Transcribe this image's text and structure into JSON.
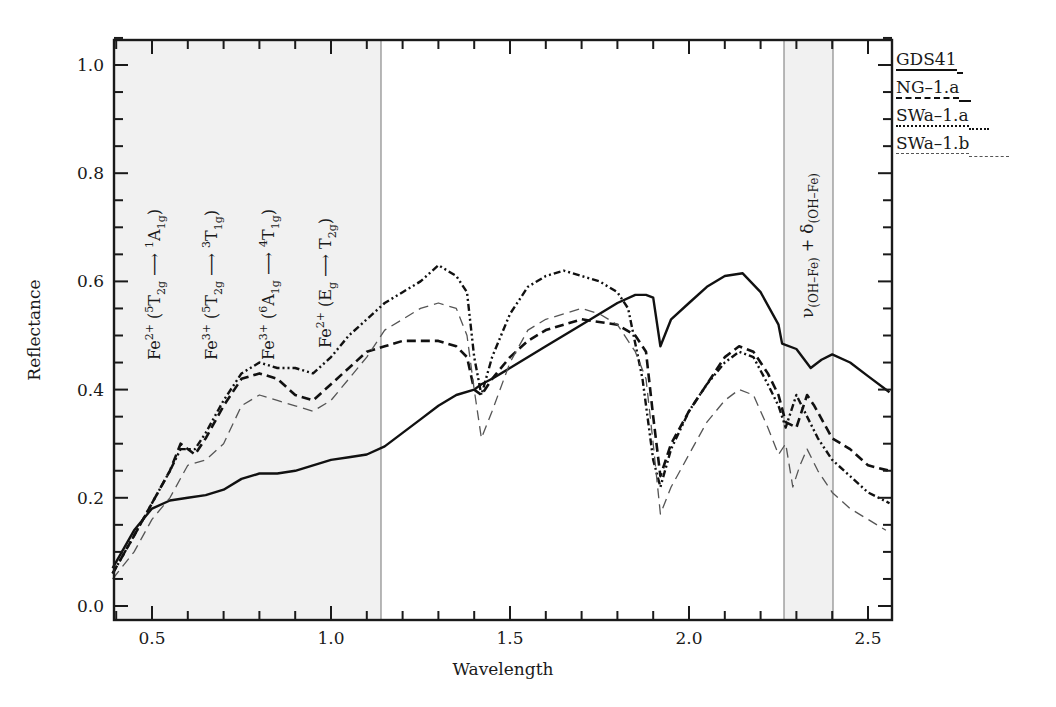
{
  "chart_data": {
    "type": "line",
    "title": "",
    "xlabel": "Wavelength",
    "ylabel": "Reflectance",
    "xlim": [
      0.39,
      2.56
    ],
    "ylim": [
      -0.02,
      1.05
    ],
    "x_ticks": [
      "0.5",
      "1.0",
      "1.5",
      "2.0",
      "2.5"
    ],
    "y_ticks": [
      "0.0",
      "0.2",
      "0.4",
      "0.6",
      "0.8",
      "1.0"
    ],
    "grid": false,
    "legend_position": "right-top",
    "legend": [
      "GDS41",
      "NG–1.a",
      "SWa–1.a",
      "SWa–1.b"
    ],
    "shaded_regions": [
      {
        "from": 0.39,
        "to": 1.14,
        "label": "Fe crystal-field transitions"
      },
      {
        "from": 2.26,
        "to": 2.4,
        "label": "ν(OH–Fe) + δ(OH–Fe)"
      }
    ],
    "annotations": [
      {
        "text": "Fe2+ (5T2g → 1A1g)",
        "x": 0.52
      },
      {
        "text": "Fe3+ (5T2g → 3T1g)",
        "x": 0.67
      },
      {
        "text": "Fe3+ (6A1g → 4T1g)",
        "x": 0.83
      },
      {
        "text": "Fe2+ (Eg → T2g)",
        "x": 0.99
      },
      {
        "text": "ν(OH–Fe) + δ(OH–Fe)",
        "x": 2.32
      }
    ],
    "series": [
      {
        "name": "GDS41",
        "style": "solid",
        "x": [
          0.39,
          0.45,
          0.5,
          0.55,
          0.6,
          0.65,
          0.7,
          0.75,
          0.8,
          0.85,
          0.9,
          0.95,
          1.0,
          1.05,
          1.1,
          1.15,
          1.2,
          1.25,
          1.3,
          1.35,
          1.4,
          1.42,
          1.45,
          1.5,
          1.6,
          1.7,
          1.8,
          1.85,
          1.88,
          1.9,
          1.92,
          1.95,
          2.0,
          2.05,
          2.1,
          2.15,
          2.2,
          2.25,
          2.26,
          2.3,
          2.34,
          2.37,
          2.4,
          2.45,
          2.5,
          2.56
        ],
        "values": [
          0.07,
          0.14,
          0.18,
          0.195,
          0.2,
          0.205,
          0.215,
          0.235,
          0.245,
          0.245,
          0.25,
          0.26,
          0.27,
          0.275,
          0.28,
          0.295,
          0.32,
          0.345,
          0.37,
          0.39,
          0.4,
          0.41,
          0.42,
          0.44,
          0.48,
          0.52,
          0.56,
          0.575,
          0.575,
          0.57,
          0.48,
          0.53,
          0.56,
          0.59,
          0.61,
          0.615,
          0.58,
          0.52,
          0.485,
          0.475,
          0.44,
          0.455,
          0.465,
          0.45,
          0.425,
          0.395
        ]
      },
      {
        "name": "NG–1.a",
        "style": "dashed-bold",
        "x": [
          0.39,
          0.45,
          0.5,
          0.55,
          0.58,
          0.62,
          0.65,
          0.7,
          0.75,
          0.8,
          0.85,
          0.9,
          0.95,
          1.0,
          1.05,
          1.1,
          1.15,
          1.2,
          1.25,
          1.3,
          1.35,
          1.38,
          1.4,
          1.42,
          1.45,
          1.5,
          1.55,
          1.6,
          1.65,
          1.7,
          1.8,
          1.85,
          1.88,
          1.9,
          1.92,
          1.95,
          2.0,
          2.05,
          2.1,
          2.14,
          2.18,
          2.22,
          2.25,
          2.27,
          2.3,
          2.33,
          2.35,
          2.4,
          2.45,
          2.5,
          2.56
        ],
        "values": [
          0.06,
          0.13,
          0.19,
          0.25,
          0.3,
          0.28,
          0.31,
          0.37,
          0.42,
          0.43,
          0.42,
          0.39,
          0.38,
          0.41,
          0.44,
          0.47,
          0.48,
          0.49,
          0.49,
          0.49,
          0.48,
          0.46,
          0.4,
          0.39,
          0.42,
          0.46,
          0.49,
          0.51,
          0.52,
          0.53,
          0.52,
          0.5,
          0.47,
          0.35,
          0.24,
          0.3,
          0.36,
          0.41,
          0.46,
          0.48,
          0.47,
          0.43,
          0.39,
          0.34,
          0.33,
          0.39,
          0.37,
          0.31,
          0.29,
          0.26,
          0.25
        ]
      },
      {
        "name": "SWa–1.a",
        "style": "dash-dot-dot",
        "x": [
          0.39,
          0.45,
          0.5,
          0.55,
          0.58,
          0.62,
          0.65,
          0.7,
          0.75,
          0.8,
          0.85,
          0.9,
          0.95,
          1.0,
          1.05,
          1.1,
          1.15,
          1.2,
          1.25,
          1.3,
          1.35,
          1.38,
          1.4,
          1.42,
          1.45,
          1.5,
          1.55,
          1.6,
          1.65,
          1.7,
          1.75,
          1.8,
          1.83,
          1.87,
          1.9,
          1.92,
          1.95,
          2.0,
          2.05,
          2.1,
          2.14,
          2.18,
          2.22,
          2.25,
          2.27,
          2.3,
          2.33,
          2.36,
          2.4,
          2.45,
          2.5,
          2.56
        ],
        "values": [
          0.06,
          0.13,
          0.19,
          0.25,
          0.29,
          0.29,
          0.32,
          0.38,
          0.43,
          0.45,
          0.44,
          0.44,
          0.43,
          0.46,
          0.5,
          0.53,
          0.56,
          0.58,
          0.6,
          0.63,
          0.61,
          0.58,
          0.46,
          0.39,
          0.46,
          0.54,
          0.59,
          0.61,
          0.62,
          0.61,
          0.6,
          0.58,
          0.55,
          0.42,
          0.27,
          0.22,
          0.29,
          0.36,
          0.41,
          0.45,
          0.47,
          0.46,
          0.41,
          0.37,
          0.33,
          0.39,
          0.35,
          0.31,
          0.27,
          0.24,
          0.21,
          0.19
        ]
      },
      {
        "name": "SWa–1.b",
        "style": "dashed-light",
        "x": [
          0.39,
          0.45,
          0.5,
          0.55,
          0.6,
          0.65,
          0.7,
          0.75,
          0.8,
          0.85,
          0.9,
          0.95,
          1.0,
          1.05,
          1.1,
          1.15,
          1.2,
          1.25,
          1.3,
          1.35,
          1.38,
          1.4,
          1.42,
          1.45,
          1.5,
          1.55,
          1.6,
          1.65,
          1.7,
          1.75,
          1.8,
          1.85,
          1.88,
          1.9,
          1.92,
          1.95,
          2.0,
          2.05,
          2.1,
          2.14,
          2.18,
          2.22,
          2.25,
          2.27,
          2.29,
          2.31,
          2.33,
          2.36,
          2.4,
          2.45,
          2.5,
          2.55
        ],
        "values": [
          0.05,
          0.1,
          0.16,
          0.2,
          0.26,
          0.27,
          0.3,
          0.37,
          0.39,
          0.38,
          0.37,
          0.36,
          0.38,
          0.42,
          0.46,
          0.51,
          0.53,
          0.55,
          0.56,
          0.55,
          0.5,
          0.4,
          0.31,
          0.36,
          0.45,
          0.51,
          0.53,
          0.54,
          0.55,
          0.54,
          0.52,
          0.47,
          0.42,
          0.3,
          0.17,
          0.22,
          0.28,
          0.34,
          0.38,
          0.4,
          0.39,
          0.33,
          0.28,
          0.3,
          0.22,
          0.26,
          0.29,
          0.25,
          0.21,
          0.18,
          0.16,
          0.14
        ]
      }
    ]
  },
  "axes": {
    "x_title": "Wavelength",
    "y_title": "Reflectance"
  },
  "legend": {
    "items": [
      "GDS41",
      "NG–1.a",
      "SWa–1.a",
      "SWa–1.b"
    ]
  },
  "annotations": {
    "a1": {
      "ion": "Fe",
      "charge": "2+",
      "open": " (",
      "pre": "5",
      "from": "T",
      "from_sub": "2g",
      "arrow": " ⟶ ",
      "post": "1",
      "to": "A",
      "to_sub": "1g",
      "close": ")"
    },
    "a2": {
      "ion": "Fe",
      "charge": "3+",
      "open": " (",
      "pre": "5",
      "from": "T",
      "from_sub": "2g",
      "arrow": " ⟶ ",
      "post": "3",
      "to": "T",
      "to_sub": "1g",
      "close": ")"
    },
    "a3": {
      "ion": "Fe",
      "charge": "3+",
      "open": " (",
      "pre": "6",
      "from": "A",
      "from_sub": "1g",
      "arrow": " ⟶ ",
      "post": "4",
      "to": "T",
      "to_sub": "1g",
      "close": ")"
    },
    "a4": {
      "ion": "Fe",
      "charge": "2+",
      "open": " (",
      "pre": "",
      "from": "E",
      "from_sub": "g",
      "arrow": " ⟶ ",
      "post": "",
      "to": "T",
      "to_sub": "2g",
      "close": ")"
    },
    "oh": {
      "nu": "ν",
      "nu_sub": "(OH–Fe)",
      "plus": " + ",
      "delta": "δ",
      "delta_sub": "(OH–Fe)"
    }
  },
  "colors": {
    "axis": "#1a1a1a",
    "shade": "#f1f1f1",
    "band_edge": "#8a8a8a",
    "series_dark": "#111111",
    "series_light": "#555555"
  }
}
